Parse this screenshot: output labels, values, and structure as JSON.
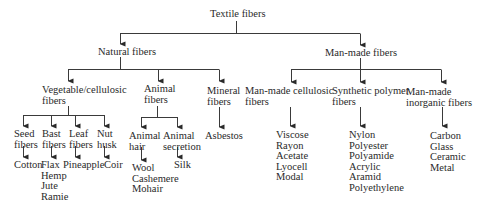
{
  "root": {
    "label": "Textile fibers"
  },
  "natural": {
    "label": "Natural fibers",
    "vegetable": {
      "label_lines": [
        "Vegetable/cellulosic",
        "fibers"
      ],
      "seed": {
        "label_lines": [
          "Seed",
          "fibers"
        ],
        "items": [
          "Cotton"
        ]
      },
      "bast": {
        "label_lines": [
          "Bast",
          "fibers"
        ],
        "items": [
          "Flax",
          "Hemp",
          "Jute",
          "Ramie"
        ]
      },
      "leaf": {
        "label_lines": [
          "Leaf",
          "fibers"
        ],
        "items": [
          "Pineapple"
        ]
      },
      "nut": {
        "label_lines": [
          "Nut",
          "husk"
        ],
        "items": [
          "Coir"
        ]
      }
    },
    "animal": {
      "label_lines": [
        "Animal",
        "fibers"
      ],
      "hair": {
        "label_lines": [
          "Animal",
          "hair"
        ],
        "items": [
          "Wool",
          "Cashemere",
          "Mohair"
        ]
      },
      "secretion": {
        "label_lines": [
          "Animal",
          "secretion"
        ],
        "items": [
          "Silk"
        ]
      }
    },
    "mineral": {
      "label_lines": [
        "Mineral",
        "fibers"
      ],
      "items": [
        "Asbestos"
      ]
    }
  },
  "manmade": {
    "label": "Man-made fibers",
    "cellulosic": {
      "label_lines": [
        "Man-made cellulosic",
        "fibers"
      ],
      "items": [
        "Viscose",
        "Rayon",
        "Acetate",
        "Lyocell",
        "Modal"
      ]
    },
    "synthetic": {
      "label_lines": [
        "Synthetic polymer",
        "fibers"
      ],
      "items": [
        "Nylon",
        "Polyester",
        "Polyamide",
        "Acrylic",
        "Aramid",
        "Polyethylene"
      ]
    },
    "inorganic": {
      "label_lines": [
        "Man-made",
        "inorganic fibers"
      ],
      "items": [
        "Carbon",
        "Glass",
        "Ceramic",
        "Metal"
      ]
    }
  }
}
